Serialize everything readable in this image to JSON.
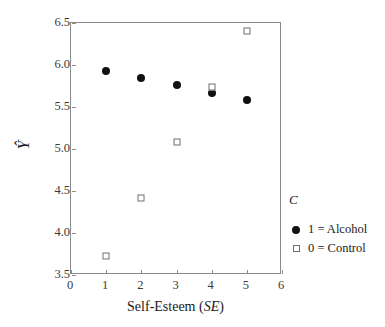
{
  "chart_data": {
    "type": "scatter",
    "title": "",
    "xlabel": "Self-Esteem (SE)",
    "xlabel_plain": "Self-Esteem (",
    "xlabel_italic": "SE",
    "xlabel_tail": ")",
    "ylabel": "Ŷ",
    "xlim": [
      0,
      6
    ],
    "ylim": [
      3.5,
      6.5
    ],
    "xticks": [
      "0",
      "1",
      "2",
      "3",
      "4",
      "5",
      "6"
    ],
    "xtick_values": [
      0,
      1,
      2,
      3,
      4,
      5,
      6
    ],
    "yticks": [
      "3.5",
      "4.0",
      "4.5",
      "5.0",
      "5.5",
      "6.0",
      "6.5"
    ],
    "ytick_values": [
      3.5,
      4.0,
      4.5,
      5.0,
      5.5,
      6.0,
      6.5
    ],
    "grid": false,
    "legend_position": "right",
    "legend_title": "C",
    "series": [
      {
        "name": "1 = Alcohol",
        "marker": "filled-circle",
        "color": "#111111",
        "x": [
          1,
          2,
          3,
          4,
          5
        ],
        "y": [
          5.93,
          5.85,
          5.76,
          5.67,
          5.58
        ]
      },
      {
        "name": "0 = Control",
        "marker": "open-square",
        "color": "#6f6f6f",
        "x": [
          1,
          2,
          3,
          4,
          5
        ],
        "y": [
          3.73,
          4.42,
          5.08,
          5.74,
          6.4
        ]
      }
    ]
  },
  "legend": {
    "title": "C",
    "entries": [
      {
        "label": "1 = Alcohol",
        "marker": "filled-circle"
      },
      {
        "label": "0 = Control",
        "marker": "open-square"
      }
    ]
  }
}
